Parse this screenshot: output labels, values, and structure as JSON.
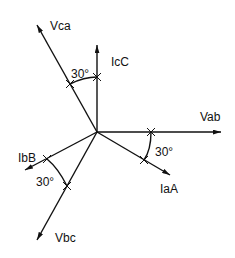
{
  "diagram": {
    "title": "",
    "origin": [
      97,
      132
    ],
    "phasors": [
      {
        "id": "vab",
        "label": "Vab",
        "end": [
          221,
          132
        ],
        "label_pos": [
          200,
          121
        ]
      },
      {
        "id": "iaa",
        "label": "IaA",
        "end": [
          170,
          175
        ],
        "label_pos": [
          160,
          193
        ]
      },
      {
        "id": "vbc",
        "label": "Vbc",
        "end": [
          37,
          240
        ],
        "label_pos": [
          55,
          242
        ]
      },
      {
        "id": "ibb",
        "label": "IbB",
        "end": [
          25,
          170
        ],
        "label_pos": [
          18,
          162
        ]
      },
      {
        "id": "vca",
        "label": "Vca",
        "end": [
          37,
          25
        ],
        "label_pos": [
          50,
          30
        ]
      },
      {
        "id": "icc",
        "label": "IcC",
        "end": [
          97,
          45
        ],
        "label_pos": [
          111,
          66
        ]
      }
    ],
    "angles": [
      {
        "label": "30°",
        "between": [
          "Vca",
          "IcC"
        ],
        "label_pos": [
          71,
          78
        ]
      },
      {
        "label": "30°",
        "between": [
          "Vab",
          "IaA"
        ],
        "label_pos": [
          155,
          156
        ]
      },
      {
        "label": "30°",
        "between": [
          "IbB",
          "Vbc"
        ],
        "label_pos": [
          36,
          186
        ]
      }
    ]
  }
}
